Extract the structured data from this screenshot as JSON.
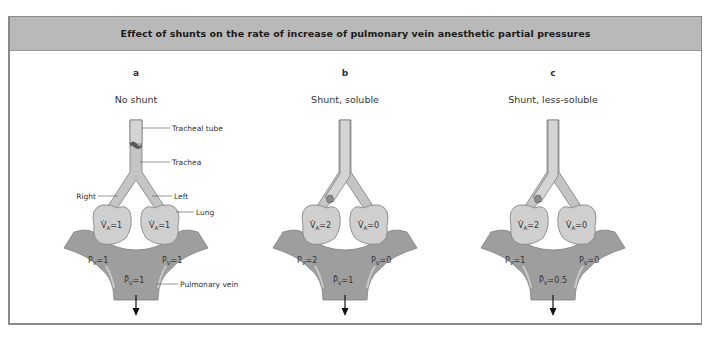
{
  "title": "Effect of shunts on the rate of increase of pulmonary vein anesthetic partial pressures",
  "colors": {
    "header_bg": "#b9b9b9",
    "frame": "#8a8a8a",
    "airway": "#c4c4c4",
    "lung": "#cfcfcf",
    "vein": "#9e9e9e",
    "text": "#333333"
  },
  "labels": {
    "tracheal_tube": "Tracheal tube",
    "trachea": "Trachea",
    "right": "Right",
    "left": "Left",
    "lung": "Lung",
    "pulmonary_vein": "Pulmonary vein"
  },
  "panels": [
    {
      "letter": "a",
      "subtitle": "No shunt",
      "va_right": "V̇A=1",
      "va_left": "V̇A=1",
      "va_right_value": "1",
      "va_left_value": "1",
      "pv_right_value": "1",
      "pv_left_value": "1",
      "pv_mixed_value": "1"
    },
    {
      "letter": "b",
      "subtitle": "Shunt, soluble",
      "va_right_value": "2",
      "va_left_value": "0",
      "pv_right_value": "2",
      "pv_left_value": "0",
      "pv_mixed_value": "1"
    },
    {
      "letter": "c",
      "subtitle": "Shunt, less-soluble",
      "va_right_value": "2",
      "va_left_value": "0",
      "pv_right_value": "1",
      "pv_left_value": "0",
      "pv_mixed_value": "0.5"
    }
  ]
}
